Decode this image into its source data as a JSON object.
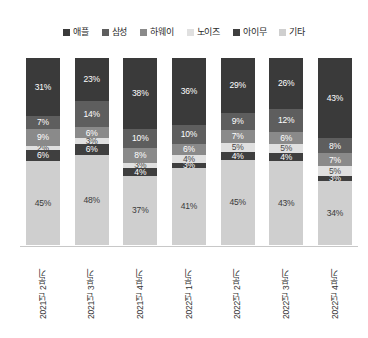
{
  "chart_data": {
    "type": "bar",
    "title": "",
    "subtitle": "",
    "xlabel": "",
    "ylabel": "",
    "ylim": [
      0,
      100
    ],
    "grid": false,
    "stacked": true,
    "stack_total_percent": 100,
    "legend_position": "top",
    "orientation": "vertical",
    "value_suffix": "%",
    "categories": [
      "2021년 2분기",
      "2021년 3분기",
      "2021년 4분기",
      "2022년 1분기",
      "2022년 2분기",
      "2022년 3분기",
      "2022년 4분기"
    ],
    "series": [
      {
        "name": "애플",
        "color": "#3a3a3a",
        "label_color": "#ffffff",
        "values": [
          31,
          23,
          38,
          36,
          29,
          26,
          43
        ],
        "labels": [
          "31%",
          "23%",
          "38%",
          "36%",
          "29%",
          "26%",
          "43%"
        ]
      },
      {
        "name": "삼성",
        "color": "#5e5e5e",
        "label_color": "#ffffff",
        "values": [
          7,
          14,
          10,
          10,
          9,
          12,
          8
        ],
        "labels": [
          "7%",
          "14%",
          "10%",
          "10%",
          "9%",
          "12%",
          "8%"
        ]
      },
      {
        "name": "하웨이",
        "color": "#8a8a8a",
        "label_color": "#ffffff",
        "values": [
          9,
          6,
          8,
          6,
          7,
          6,
          7
        ],
        "labels": [
          "9%",
          "6%",
          "8%",
          "6%",
          "7%",
          "6%",
          "7%"
        ]
      },
      {
        "name": "노이즈",
        "color": "#e0e0e0",
        "label_color": "#4a4a4a",
        "values": [
          2,
          3,
          3,
          4,
          5,
          5,
          5
        ],
        "labels": [
          "2%",
          "3%",
          "3%",
          "4%",
          "5%",
          "5%",
          "5%"
        ]
      },
      {
        "name": "아이무",
        "color": "#3f3f3f",
        "label_color": "#ffffff",
        "values": [
          6,
          6,
          4,
          3,
          4,
          4,
          3
        ],
        "labels": [
          "6%",
          "6%",
          "4%",
          "3%",
          "4%",
          "4%",
          "3%"
        ]
      },
      {
        "name": "기타",
        "color": "#cfcfcf",
        "label_color": "#3a3a3a",
        "values": [
          45,
          48,
          37,
          41,
          45,
          43,
          34
        ],
        "labels": [
          "45%",
          "48%",
          "37%",
          "41%",
          "45%",
          "43%",
          "34%"
        ]
      }
    ]
  }
}
